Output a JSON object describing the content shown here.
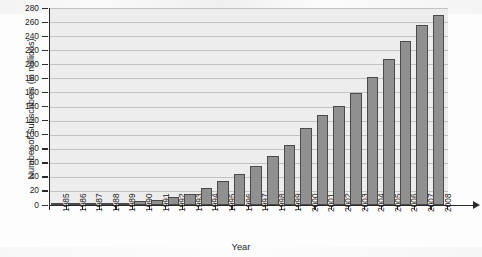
{
  "chart_data": {
    "type": "bar",
    "title": "",
    "xlabel": "Year",
    "ylabel": "Number of Subscribers (in millions)",
    "categories": [
      "1985",
      "1986",
      "1987",
      "1988",
      "1989",
      "1990",
      "1991",
      "1992",
      "1993",
      "1994",
      "1995",
      "1996",
      "1997",
      "1998",
      "1999",
      "2000",
      "2001",
      "2002",
      "2003",
      "2004",
      "2005",
      "2006",
      "2007",
      "2008"
    ],
    "values": [
      0.3,
      0.7,
      1.2,
      2.1,
      3.5,
      5.3,
      7.6,
      11.0,
      16.0,
      24.1,
      33.8,
      44.0,
      55.3,
      69.2,
      86.0,
      109.5,
      128.4,
      140.8,
      158.7,
      182.1,
      207.9,
      233.0,
      255.4,
      270.3
    ],
    "ylim": [
      0,
      280
    ],
    "yticks": [
      0,
      20,
      40,
      60,
      80,
      100,
      120,
      140,
      160,
      180,
      200,
      220,
      240,
      260,
      280
    ],
    "grid": true,
    "legend": "none",
    "series_color": "#909090",
    "bar_border_color": "#4a4a4a",
    "plot_background": "#ededed",
    "gridline_color": "#c2c2c2",
    "axis_color": "#2b2b2b"
  }
}
